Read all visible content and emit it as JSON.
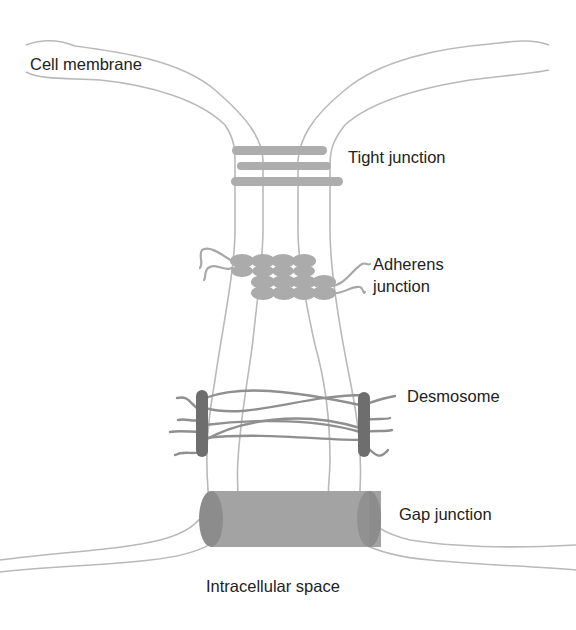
{
  "diagram": {
    "labels": {
      "cell_membrane": "Cell membrane",
      "tight_junction": "Tight junction",
      "adherens_junction_line1": "Adherens",
      "adherens_junction_line2": "junction",
      "desmosome": "Desmosome",
      "gap_junction": "Gap junction",
      "intracellular_space": "Intracellular space"
    },
    "colors": {
      "membrane": "#b9b9b9",
      "tight_junction_strand": "#adadad",
      "adherens_cadherin": "#ababab",
      "desmosome_plaque": "#6e6e6e",
      "desmosome_filament": "#8f8f8f",
      "gap_junction_body": "#a3a3a3",
      "gap_junction_end": "#8c8c8c",
      "text": "#222222"
    }
  }
}
